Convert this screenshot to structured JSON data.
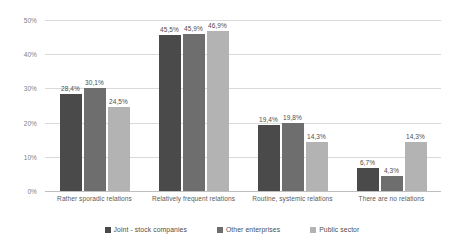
{
  "chart_data": {
    "type": "bar",
    "title": "",
    "subtitle": "",
    "xlabel": "",
    "ylabel": "",
    "ylim": [
      0,
      50
    ],
    "y_ticks": [
      "0%",
      "10%",
      "20%",
      "30%",
      "40%",
      "50%"
    ],
    "y_tick_values": [
      0,
      10,
      20,
      30,
      40,
      50
    ],
    "grid": true,
    "legend_position": "bottom",
    "value_suffix": "%",
    "decimal_separator": ",",
    "categories": [
      "Rather sporadic relations",
      "Relatively frequent relations",
      "Routine, systemic relations",
      "There are no relations"
    ],
    "series": [
      {
        "name": "Joint - stock companies",
        "color": "#4a4a4a",
        "values": [
          28.4,
          45.5,
          19.4,
          6.7
        ],
        "labels": [
          "28,4%",
          "45,5%",
          "19,4%",
          "6,7%"
        ]
      },
      {
        "name": "Other enterprises",
        "color": "#6e6e6e",
        "values": [
          30.1,
          45.9,
          19.8,
          4.3
        ],
        "labels": [
          "30,1%",
          "45,9%",
          "19,8%",
          "4,3%"
        ]
      },
      {
        "name": "Public sector",
        "color": "#b3b3b3",
        "values": [
          24.5,
          46.9,
          14.3,
          14.3
        ],
        "labels": [
          "24,5%",
          "46,9%",
          "14,3%",
          "14,3%"
        ]
      }
    ]
  }
}
